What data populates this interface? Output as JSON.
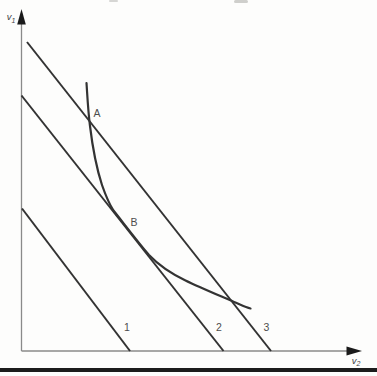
{
  "figure": {
    "background": "#fdfdfc",
    "ink_color": "#333333",
    "axis_color": "#8a8a8a",
    "label_color": "#4d4d4d",
    "divider_color": "#1c1c1c"
  },
  "axes": {
    "y": {
      "label": "v",
      "sub": "1",
      "x": 11,
      "y": 20,
      "line": "M21.5,13 L21.5,351",
      "arrow": "21.5,9 17.2,24.5 25.8,24.5"
    },
    "x": {
      "label": "v",
      "sub": "2",
      "x": 356,
      "y": 363.5,
      "line": "M21.5,351 L352,351",
      "arrow": "362,351 346.5,346.6 346.5,355.4"
    }
  },
  "lines": [
    {
      "id": "line-1",
      "path": "M22,208.5 L130,351",
      "label": {
        "text": "1",
        "x": 127,
        "y": 331
      }
    },
    {
      "id": "line-2",
      "path": "M21.5,95.5 L223.5,351",
      "label": {
        "text": "2",
        "x": 219,
        "y": 331
      }
    },
    {
      "id": "line-3",
      "path": "M27,42 L271,351",
      "label": {
        "text": "3",
        "x": 266.5,
        "y": 331
      }
    }
  ],
  "curve": {
    "path": "M86.5,83 C87.5,98 88,110 90,126 C92.5,147 96.5,168 102,185 C106,196.5 109.5,204.5 113.5,210.5 C125,225 137,241 149,255 C158.5,265 171,273.5 185.5,280.5 C200,287.5 218,295 234,302 C240,304.5 246,307.5 250.5,308.5",
    "start": [
      86.5,
      83
    ],
    "crossing_A": [
      88.5,
      119
    ],
    "tangency_B": [
      131,
      233
    ],
    "lower_crossing_line3": [
      235,
      304
    ],
    "end": [
      250.5,
      308.5
    ]
  },
  "point_labels": {
    "A": {
      "text": "A",
      "x": 97,
      "y": 117
    },
    "B": {
      "text": "B",
      "x": 134,
      "y": 226
    }
  }
}
